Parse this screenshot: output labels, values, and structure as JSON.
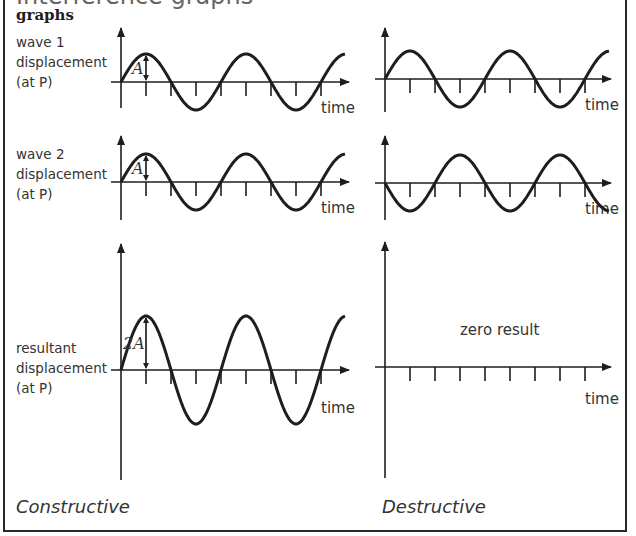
{
  "header": {
    "title_partial": "Interference graphs",
    "section_heading": "graphs"
  },
  "rows": [
    {
      "label_lines": [
        "wave 1",
        "displacement",
        "(at P)"
      ]
    },
    {
      "label_lines": [
        "wave 2",
        "displacement",
        "(at P)"
      ]
    },
    {
      "label_lines": [
        "resultant",
        "displacement",
        "(at P)"
      ]
    }
  ],
  "axis": {
    "time_label": "time"
  },
  "annotations": {
    "amplitude_label": "A",
    "double_amplitude_label": "2A",
    "zero_result_label": "zero result"
  },
  "columns": {
    "left_caption": "Constructive",
    "right_caption": "Destructive"
  },
  "chart_data": [
    {
      "type": "line",
      "title": "wave 1 (constructive)",
      "xlabel": "time",
      "ylabel": "wave 1 displacement (at P)",
      "amplitude": 1,
      "phase": 0,
      "periods": 2.25,
      "ticks": 8
    },
    {
      "type": "line",
      "title": "wave 2 (constructive)",
      "xlabel": "time",
      "ylabel": "wave 2 displacement (at P)",
      "amplitude": 1,
      "phase": 0,
      "periods": 2.25,
      "ticks": 8
    },
    {
      "type": "line",
      "title": "resultant (constructive)",
      "xlabel": "time",
      "ylabel": "resultant displacement (at P)",
      "amplitude": 2,
      "phase": 0,
      "periods": 2.25,
      "ticks": 8
    },
    {
      "type": "line",
      "title": "wave 1 (destructive)",
      "xlabel": "time",
      "amplitude": 1,
      "phase": 0,
      "periods": 2.25,
      "ticks": 8
    },
    {
      "type": "line",
      "title": "wave 2 (destructive)",
      "xlabel": "time",
      "amplitude": 1,
      "phase": 180,
      "periods": 2.25,
      "ticks": 8
    },
    {
      "type": "line",
      "title": "resultant (destructive)",
      "xlabel": "time",
      "amplitude": 0,
      "annotation": "zero result",
      "ticks": 8
    }
  ]
}
